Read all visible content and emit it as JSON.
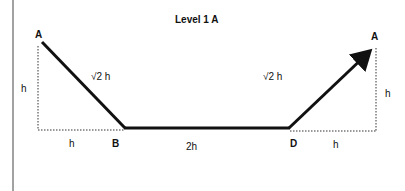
{
  "title": "Level 1 A",
  "points": {
    "start": "A",
    "b": "B",
    "d": "D",
    "end": "A"
  },
  "labels": {
    "left_height": "h",
    "left_hyp": "√2 h",
    "right_hyp": "√2 h",
    "right_height": "h",
    "left_base": "h",
    "middle_base": "2h",
    "right_base": "h"
  },
  "colors": {
    "line": "#111111",
    "dotted": "#333333",
    "border": "#444444"
  }
}
